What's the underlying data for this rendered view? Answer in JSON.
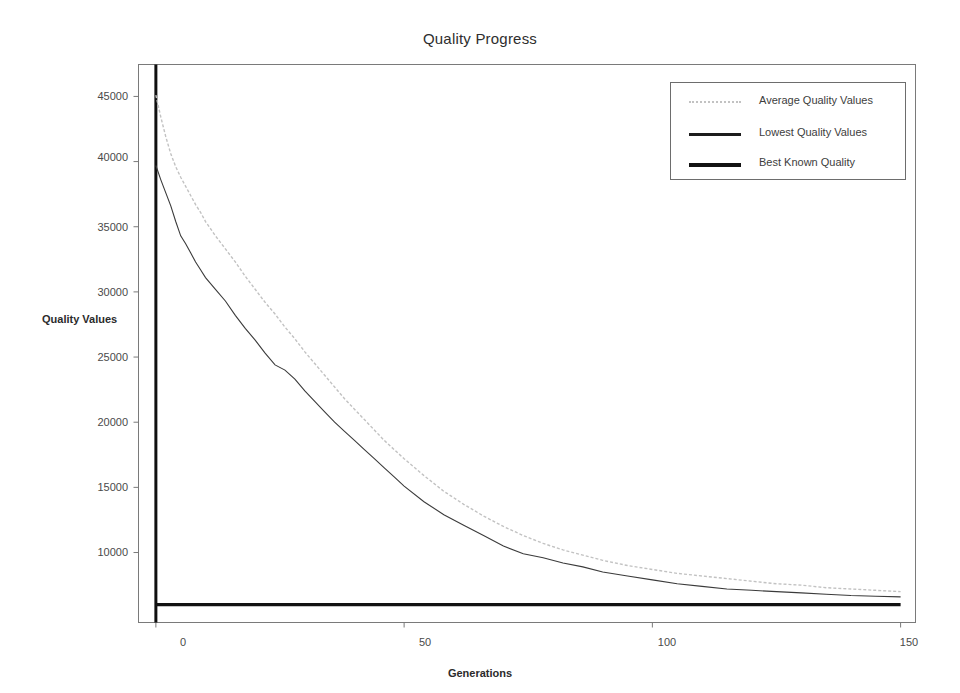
{
  "chart_data": {
    "type": "line",
    "title": "Quality Progress",
    "xlabel": "Generations",
    "ylabel": "Quality Values",
    "xlim": [
      -3.5,
      153
    ],
    "ylim": [
      4630,
      47450
    ],
    "xticks": [
      0,
      50,
      100,
      150
    ],
    "xtick_labels": [
      "0",
      "50",
      "100",
      "150"
    ],
    "yticks": [
      10000,
      15000,
      20000,
      25000,
      30000,
      35000,
      40000,
      45000
    ],
    "ytick_labels": [
      "10000",
      "15000",
      "20000",
      "25000",
      "30000",
      "35000",
      "40000",
      "45000"
    ],
    "grid": false,
    "legend_position": "upper right",
    "series": [
      {
        "name": "Average Quality Values",
        "style": "dotted",
        "color": "#c2c2c2",
        "x": [
          0,
          1,
          2,
          3,
          4,
          5,
          6,
          7,
          8,
          9,
          10,
          12,
          14,
          16,
          18,
          20,
          22,
          24,
          26,
          28,
          30,
          32,
          34,
          36,
          38,
          40,
          42,
          44,
          46,
          48,
          50,
          54,
          58,
          62,
          66,
          70,
          74,
          78,
          82,
          86,
          90,
          95,
          100,
          105,
          110,
          115,
          120,
          125,
          130,
          135,
          140,
          145,
          150
        ],
        "values": [
          45100,
          43400,
          41900,
          40600,
          39600,
          38800,
          38100,
          37400,
          36700,
          36100,
          35400,
          34300,
          33300,
          32300,
          31200,
          30200,
          29200,
          28300,
          27300,
          26400,
          25400,
          24500,
          23600,
          22700,
          21800,
          21000,
          20200,
          19400,
          18600,
          17900,
          17200,
          15900,
          14700,
          13700,
          12800,
          12000,
          11300,
          10700,
          10200,
          9800,
          9400,
          9000,
          8700,
          8400,
          8200,
          8000,
          7800,
          7600,
          7500,
          7300,
          7200,
          7100,
          7000
        ]
      },
      {
        "name": "Lowest Quality Values",
        "style": "solid",
        "color": "#3b3b3b",
        "x": [
          0,
          1,
          2,
          3,
          4,
          5,
          6,
          7,
          8,
          9,
          10,
          12,
          14,
          16,
          18,
          20,
          22,
          24,
          26,
          28,
          30,
          32,
          34,
          36,
          38,
          40,
          42,
          44,
          46,
          48,
          50,
          54,
          58,
          62,
          66,
          70,
          74,
          78,
          82,
          86,
          90,
          95,
          100,
          105,
          110,
          115,
          120,
          125,
          130,
          135,
          140,
          145,
          150
        ],
        "values": [
          39700,
          38600,
          37600,
          36600,
          35400,
          34300,
          33700,
          33000,
          32300,
          31700,
          31100,
          30200,
          29300,
          28200,
          27200,
          26300,
          25300,
          24400,
          24000,
          23300,
          22400,
          21600,
          20800,
          20000,
          19300,
          18600,
          17900,
          17200,
          16500,
          15800,
          15100,
          13900,
          12900,
          12100,
          11300,
          10500,
          9900,
          9600,
          9200,
          8900,
          8500,
          8200,
          7900,
          7600,
          7400,
          7200,
          7100,
          7000,
          6900,
          6800,
          6700,
          6650,
          6600
        ]
      },
      {
        "name": "Best Known Quality",
        "style": "solid-thick",
        "color": "#121212",
        "x": [
          0,
          150
        ],
        "values": [
          6000,
          6000
        ]
      }
    ],
    "annotations": {
      "vertical_marker_x": 0
    }
  },
  "legend": {
    "items": [
      {
        "label": "Average Quality Values",
        "swatch": "dotted-light"
      },
      {
        "label": "Lowest Quality Values",
        "swatch": "solid-dark"
      },
      {
        "label": "Best Known Quality",
        "swatch": "solid-thick-dark"
      }
    ]
  }
}
